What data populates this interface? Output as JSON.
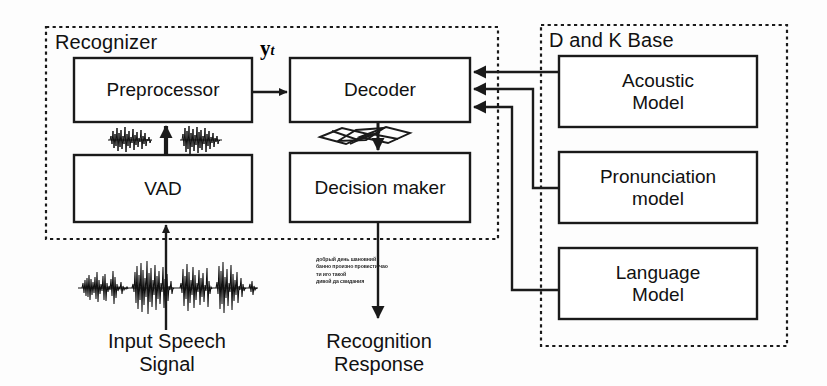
{
  "figure": {
    "panels": [
      {
        "id": "recognizer",
        "title": "Recognizer"
      },
      {
        "id": "dk_base",
        "title": "D and K Base"
      }
    ],
    "boxes": [
      {
        "id": "preprocessor",
        "label": "Preprocessor"
      },
      {
        "id": "vad",
        "label": "VAD"
      },
      {
        "id": "decoder",
        "label": "Decoder"
      },
      {
        "id": "decision_maker",
        "label": "Decision maker"
      },
      {
        "id": "acoustic_model",
        "label": "Acoustic\nModel"
      },
      {
        "id": "pronunciation_model",
        "label": "Pronunciation\nmodel"
      },
      {
        "id": "language_model",
        "label": "Language\nModel"
      }
    ],
    "labels": {
      "input_signal": "Input Speech\nSignal",
      "recognition_response": "Recognition\nResponse",
      "feature_vector": "y",
      "feature_vector_sub": "t",
      "transcript_sample": "добрый день шановний\nбанно произно провести чао\nти иго такой\nдивой да свидания"
    },
    "graphics": [
      {
        "id": "input-waveform",
        "name": "speech-waveform"
      },
      {
        "id": "vad-waveform-left",
        "name": "speech-waveform-segment"
      },
      {
        "id": "vad-waveform-right",
        "name": "speech-waveform-segment"
      },
      {
        "id": "word-lattice",
        "name": "word-lattice"
      }
    ],
    "colors": {
      "stroke": "#1a1a1a",
      "background": "#fdfdfd",
      "text": "#111111"
    }
  }
}
